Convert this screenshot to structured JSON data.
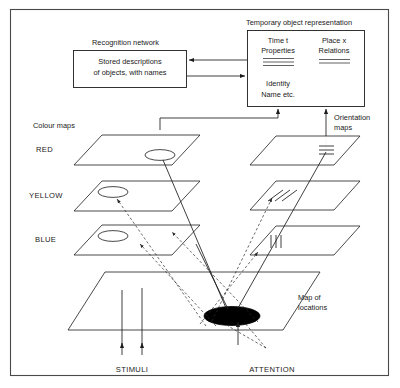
{
  "figure": {
    "border_color": "#4a4a4a",
    "background": "#ffffff",
    "line_color": "#1c1c1c"
  },
  "labels": {
    "temporary_object_representation": "Temporary object representation",
    "recognition_network": "Recognition network",
    "colour_maps": "Colour maps",
    "orientation_maps_line1": "Orientation",
    "orientation_maps_line2": "maps",
    "map_of_locations_line1": "Map of",
    "map_of_locations_line2": "locations",
    "stimuli": "STIMULI",
    "attention": "ATTENTION"
  },
  "recognition_box": {
    "line1": "Stored descriptions",
    "line2": "of objects, with names"
  },
  "temporary_box": {
    "left_column": {
      "line1": "Time t",
      "line2": "Properties",
      "rule_count": 3
    },
    "right_column": {
      "line1": "Place x",
      "line2": "Relations",
      "rule_count": 2
    },
    "footer_line1": "Identity",
    "footer_line2": "Name etc."
  },
  "colour_maps": {
    "title": "Colour maps",
    "planes": [
      {
        "name": "RED",
        "label": "RED",
        "has_blob": true,
        "blob_filled": false
      },
      {
        "name": "YELLOW",
        "label": "YELLOW",
        "has_blob": true,
        "blob_filled": false
      },
      {
        "name": "BLUE",
        "label": "BLUE",
        "has_blob": true,
        "blob_filled": false
      }
    ]
  },
  "orientation_maps": {
    "title": "Orientation maps",
    "planes": [
      {
        "name": "horizontal",
        "glyph": "horizontal-bars",
        "bar_count": 3
      },
      {
        "name": "oblique",
        "glyph": "diagonal-bars",
        "bar_count": 3
      },
      {
        "name": "vertical",
        "glyph": "vertical-bars",
        "bar_count": 3
      }
    ]
  },
  "map_of_locations": {
    "title": "Map of locations",
    "attention_blob": {
      "filled": true,
      "color": "#000000"
    }
  },
  "connections": {
    "recognition_to_temporary": "arrow-right",
    "temporary_to_recognition": "arrow-left",
    "colour_to_temporary": "arrow-up",
    "orientation_to_temporary": "arrow-up",
    "stimuli_to_map": "arrow-up",
    "attention_to_map": "arrow-up",
    "attention_spread": "dashed-arrows"
  }
}
